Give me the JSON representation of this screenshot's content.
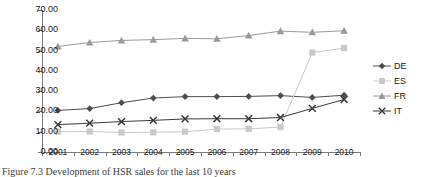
{
  "chart_data": {
    "type": "line",
    "title": "",
    "xlabel": "",
    "ylabel": "",
    "categories": [
      "2001",
      "2002",
      "2003",
      "2004",
      "2005",
      "2006",
      "2007",
      "2008",
      "2009",
      "2010"
    ],
    "ylim": [
      0,
      70
    ],
    "ytick_step": 10,
    "ytick_labels": [
      "0.00",
      "10.00",
      "20.00",
      "30.00",
      "40.00",
      "50.00",
      "60.00",
      "70.00"
    ],
    "grid": false,
    "legend_position": "right",
    "series": [
      {
        "name": "DE",
        "marker": "diamond",
        "color": "#4d4d4d",
        "values": [
          20.5,
          21.4,
          24.3,
          26.6,
          27.3,
          27.3,
          27.4,
          27.8,
          26.9,
          28.0
        ]
      },
      {
        "name": "ES",
        "marker": "square",
        "color": "#c9c9c9",
        "values": [
          10.0,
          10.1,
          9.6,
          9.7,
          10.0,
          11.3,
          11.4,
          12.3,
          49.0,
          51.2
        ]
      },
      {
        "name": "FR",
        "marker": "triangle",
        "color": "#9a9a9a",
        "values": [
          52.0,
          54.0,
          55.0,
          55.4,
          56.0,
          55.8,
          57.4,
          59.6,
          59.0,
          59.8
        ]
      },
      {
        "name": "IT",
        "marker": "cross",
        "color": "#3a3a3a",
        "values": [
          13.5,
          14.2,
          15.0,
          15.6,
          16.3,
          16.4,
          16.4,
          17.0,
          21.5,
          25.9
        ]
      }
    ]
  },
  "legend": {
    "entries": [
      {
        "label": "DE"
      },
      {
        "label": "ES"
      },
      {
        "label": "FR"
      },
      {
        "label": "IT"
      }
    ]
  },
  "caption": {
    "text": "Figure 7.3 Development of HSR sales for the last 10 years"
  }
}
